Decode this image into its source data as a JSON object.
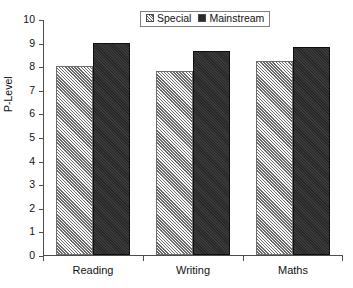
{
  "chart_data": {
    "type": "bar",
    "title": "",
    "xlabel": "",
    "ylabel": "P-Level",
    "categories": [
      "Reading",
      "Writing",
      "Maths"
    ],
    "series": [
      {
        "name": "Special",
        "values": [
          8.0,
          7.8,
          8.2
        ],
        "color": "#bdbdbd",
        "pattern": "hatched"
      },
      {
        "name": "Mainstream",
        "values": [
          9.0,
          8.65,
          8.8
        ],
        "color": "#2c2c2c",
        "pattern": "solid"
      }
    ],
    "ylim": [
      0,
      10
    ],
    "yticks": [
      0,
      1,
      2,
      3,
      4,
      5,
      6,
      7,
      8,
      9,
      10
    ],
    "ytick_labels": [
      "0",
      "1",
      "2",
      "3",
      "4",
      "5",
      "6",
      "7",
      "8",
      "9",
      "10"
    ],
    "grid": false,
    "legend_position": "top-center",
    "legend_entries": [
      "Special",
      "Mainstream"
    ]
  },
  "axis": {
    "y_title": "P-Level"
  }
}
